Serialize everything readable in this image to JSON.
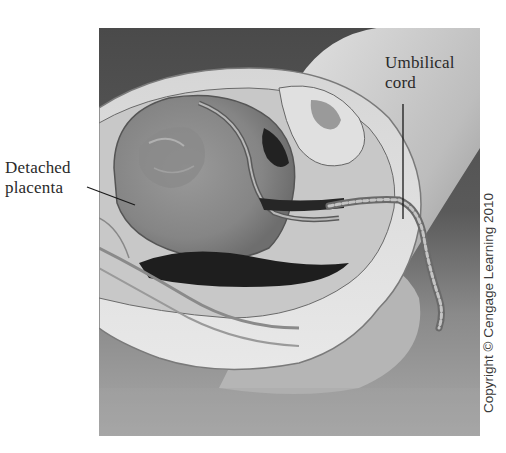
{
  "figure": {
    "labels": {
      "detached_placenta": [
        "Detached",
        "placenta"
      ],
      "umbilical_cord": [
        "Umbilical",
        "cord"
      ]
    },
    "copyright": "Copyright © Cengage Learning 2010",
    "colors": {
      "background_dark": "#4a4a4a",
      "background_floor": "#9a9a9a",
      "tissue_light": "#d8d8d8",
      "uterus_mid": "#8c8c8c",
      "label_text": "#2a2a2a"
    }
  }
}
